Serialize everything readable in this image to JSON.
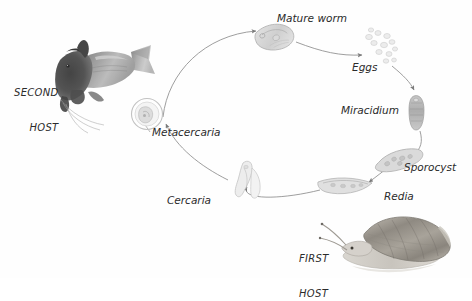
{
  "diagram": {
    "type": "cycle-diagram",
    "style": "pencil-sketch scientific illustration, italic serif-like labels, light grey curved arrows forming an oval cycle",
    "background_color": "#fefefe",
    "arrow_color": "#8c8c8c",
    "label_color": "#2b2b2b"
  },
  "stages": [
    {
      "id": "mature-worm",
      "label": "Mature worm",
      "icon": "fluke-worm-icon",
      "position": "top-center",
      "illustration": "elongated leaf-shaped adult fluke, tilted, pale grey stipple"
    },
    {
      "id": "eggs",
      "label": "Eggs",
      "icon": "eggs-cluster-icon",
      "position": "top-right",
      "illustration": "loose cluster of small pale ovoid eggs"
    },
    {
      "id": "miracidium",
      "label": "Miracidium",
      "icon": "miracidium-icon",
      "position": "right",
      "illustration": "small elongated vertical ciliated larva"
    },
    {
      "id": "sporocyst",
      "label": "Sporocyst",
      "icon": "sporocyst-icon",
      "position": "lower-right",
      "illustration": "irregular sac-like body, diagonally oriented"
    },
    {
      "id": "redia",
      "label": "Redia",
      "icon": "redia-icon",
      "position": "bottom-right",
      "illustration": "curved boat-shaped larval stage"
    },
    {
      "id": "cercaria",
      "label": "Cercaria",
      "icon": "cercaria-icon",
      "position": "bottom-left",
      "illustration": "larva with long forked swimming tail"
    },
    {
      "id": "metacercaria",
      "label": "Metacercaria",
      "icon": "metacercaria-cyst-icon",
      "position": "center-left",
      "illustration": "round encysted larva inside a faint circular cyst wall"
    }
  ],
  "hosts": [
    {
      "id": "first-host",
      "label": "FIRST\nHOST",
      "label_line1": "FIRST",
      "label_line2": "HOST",
      "icon": "snail-icon",
      "position": "bottom-right",
      "illustration": "detailed pencil-shaded snail with conical shell, head to the left"
    },
    {
      "id": "second-host",
      "label": "SECOND\nHOST",
      "label_line1": "SECOND",
      "label_line2": "HOST",
      "icon": "fish-icon",
      "position": "left",
      "illustration": "dark-headed fish facing right with forked tail, pencil shaded"
    }
  ],
  "flow": [
    {
      "from": "metacercaria",
      "to": "mature-worm"
    },
    {
      "from": "mature-worm",
      "to": "eggs"
    },
    {
      "from": "eggs",
      "to": "miracidium"
    },
    {
      "from": "miracidium",
      "to": "sporocyst"
    },
    {
      "from": "sporocyst",
      "to": "redia"
    },
    {
      "from": "redia",
      "to": "cercaria"
    },
    {
      "from": "cercaria",
      "to": "metacercaria"
    }
  ]
}
